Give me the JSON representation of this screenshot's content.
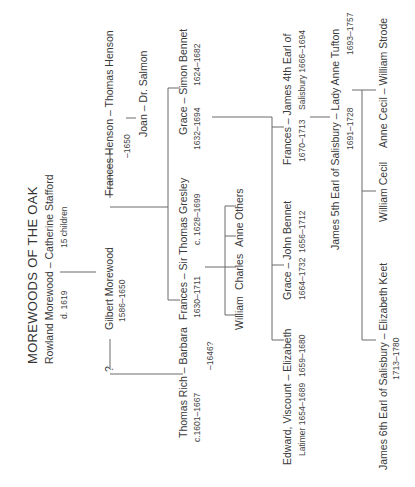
{
  "title": "MOREWOODS OF THE OAK",
  "gen1": {
    "couple": "Rowland Morewood – Catherine Stafford",
    "husband_dates": "d. 1619",
    "note": "15 children"
  },
  "gen2": {
    "unknown": "?",
    "gilbert": "Gilbert Morewood",
    "gilbert_dates": "1586–1650",
    "frances_henson": "Frances Henson – Thomas Henson",
    "frances_henson_dates": "–1650",
    "joan": "Joan – Dr. Salmon"
  },
  "gen3": {
    "rich": "Thomas Rich – Barbara",
    "rich_dates": "c.1601–1667",
    "barbara_dates": "–1646?",
    "gresley": "Frances – Sir Thomas Gresley",
    "frances_dates": "1630–1711",
    "gresley_dates": "c. 1628–1699",
    "grace": "Grace – Simon Bennet",
    "grace_dates": "1632–1694",
    "simon_dates": "1624–1682"
  },
  "gresley_children": [
    "William",
    "Charles",
    "Anne",
    "Others"
  ],
  "gen4": {
    "edward": "Edward, Viscount – Elizabeth",
    "edward_dates": "Latimer 1654–1689",
    "elizabeth_dates": "1659–1680",
    "grace_john": "Grace – John Bennet",
    "grace_john_dates1": "1664–1732",
    "grace_john_dates2": "1656–1712",
    "frances_james": "Frances – James 4th Earl of",
    "frances_james_dates1": "1670–1713",
    "frances_james_dates2": "Salisbury 1666–1694"
  },
  "gen5": {
    "james5": "James 5th Earl of Salisbury – Lady Anne Tufton",
    "james5_dates": "1691–1728",
    "anne_dates": "1693–1757"
  },
  "gen6": {
    "james6": "James 6th Earl of Salisbury – Elizabeth Keet",
    "james6_dates": "1713–1780",
    "william_cecil": "William Cecil",
    "anne_cecil": "Anne Cecil – William Strode"
  }
}
